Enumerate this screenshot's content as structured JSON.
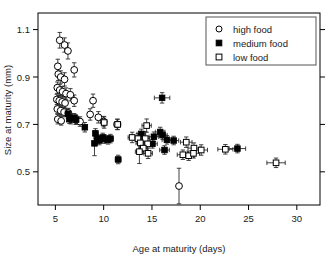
{
  "chart_data": {
    "type": "scatter",
    "title": "",
    "xlabel": "Age at maturity (days)",
    "ylabel": "Size at maturity (mm)",
    "xlim": [
      3.2,
      32.4
    ],
    "ylim": [
      0.36,
      1.17
    ],
    "xticks": [
      5,
      10,
      15,
      20,
      25,
      30
    ],
    "xticklabels": [
      "5",
      "10",
      "15",
      "20",
      "25",
      "30"
    ],
    "yticks": [
      0.5,
      0.7,
      0.9,
      1.1
    ],
    "yticklabels": [
      "0.5",
      "0.7",
      "0.9",
      "1.1"
    ],
    "grid": false,
    "legend_position": "top-right",
    "legend": [
      {
        "label": "high food",
        "marker": "open-circle"
      },
      {
        "label": "medium food",
        "marker": "filled-square"
      },
      {
        "label": "low food",
        "marker": "open-square"
      }
    ],
    "series": [
      {
        "name": "high food",
        "marker": "open-circle",
        "points": [
          {
            "x": 5.45,
            "y": 1.055,
            "xerr": 0.12,
            "yerr": 0.033
          },
          {
            "x": 5.95,
            "y": 1.035,
            "xerr": 0.14,
            "yerr": 0.03
          },
          {
            "x": 6.3,
            "y": 1.01,
            "xerr": 0.16,
            "yerr": 0.034
          },
          {
            "x": 5.25,
            "y": 0.945,
            "xerr": 0.12,
            "yerr": 0.03
          },
          {
            "x": 5.3,
            "y": 0.912,
            "xerr": 0.13,
            "yerr": 0.027
          },
          {
            "x": 5.55,
            "y": 0.9,
            "xerr": 0.14,
            "yerr": 0.026
          },
          {
            "x": 5.95,
            "y": 0.89,
            "xerr": 0.15,
            "yerr": 0.028
          },
          {
            "x": 6.95,
            "y": 0.93,
            "xerr": 0.18,
            "yerr": 0.03
          },
          {
            "x": 5.2,
            "y": 0.855,
            "xerr": 0.12,
            "yerr": 0.024
          },
          {
            "x": 5.45,
            "y": 0.845,
            "xerr": 0.13,
            "yerr": 0.024
          },
          {
            "x": 5.75,
            "y": 0.838,
            "xerr": 0.14,
            "yerr": 0.022
          },
          {
            "x": 6.1,
            "y": 0.83,
            "xerr": 0.16,
            "yerr": 0.024
          },
          {
            "x": 6.55,
            "y": 0.825,
            "xerr": 0.17,
            "yerr": 0.026
          },
          {
            "x": 5.15,
            "y": 0.805,
            "xerr": 0.12,
            "yerr": 0.022
          },
          {
            "x": 5.4,
            "y": 0.8,
            "xerr": 0.12,
            "yerr": 0.022
          },
          {
            "x": 5.7,
            "y": 0.795,
            "xerr": 0.14,
            "yerr": 0.022
          },
          {
            "x": 6.0,
            "y": 0.79,
            "xerr": 0.15,
            "yerr": 0.022
          },
          {
            "x": 6.95,
            "y": 0.8,
            "xerr": 0.18,
            "yerr": 0.024
          },
          {
            "x": 5.2,
            "y": 0.765,
            "xerr": 0.12,
            "yerr": 0.02
          },
          {
            "x": 5.55,
            "y": 0.758,
            "xerr": 0.13,
            "yerr": 0.02
          },
          {
            "x": 5.9,
            "y": 0.752,
            "xerr": 0.14,
            "yerr": 0.02
          },
          {
            "x": 6.35,
            "y": 0.748,
            "xerr": 0.16,
            "yerr": 0.02
          },
          {
            "x": 5.25,
            "y": 0.722,
            "xerr": 0.12,
            "yerr": 0.02
          },
          {
            "x": 5.6,
            "y": 0.715,
            "xerr": 0.13,
            "yerr": 0.018
          },
          {
            "x": 6.6,
            "y": 0.722,
            "xerr": 0.16,
            "yerr": 0.02
          },
          {
            "x": 7.1,
            "y": 0.72,
            "xerr": 0.17,
            "yerr": 0.02
          },
          {
            "x": 7.55,
            "y": 0.712,
            "xerr": 0.19,
            "yerr": 0.02
          },
          {
            "x": 8.9,
            "y": 0.8,
            "xerr": 0.26,
            "yerr": 0.028
          },
          {
            "x": 8.6,
            "y": 0.742,
            "xerr": 0.24,
            "yerr": 0.024
          },
          {
            "x": 9.45,
            "y": 0.73,
            "xerr": 0.26,
            "yerr": 0.024
          },
          {
            "x": 10.0,
            "y": 0.712,
            "xerr": 0.28,
            "yerr": 0.022
          },
          {
            "x": 11.4,
            "y": 0.7,
            "xerr": 0.32,
            "yerr": 0.022
          },
          {
            "x": 17.8,
            "y": 0.44,
            "xerr": 0.0,
            "yerr": 0.075
          }
        ]
      },
      {
        "name": "medium food",
        "marker": "filled-square",
        "points": [
          {
            "x": 6.3,
            "y": 0.745,
            "xerr": 0.16,
            "yerr": 0.02
          },
          {
            "x": 6.45,
            "y": 0.722,
            "xerr": 0.16,
            "yerr": 0.018
          },
          {
            "x": 6.95,
            "y": 0.728,
            "xerr": 0.17,
            "yerr": 0.018
          },
          {
            "x": 7.15,
            "y": 0.72,
            "xerr": 0.18,
            "yerr": 0.018
          },
          {
            "x": 8.05,
            "y": 0.688,
            "xerr": 0.22,
            "yerr": 0.02
          },
          {
            "x": 9.15,
            "y": 0.662,
            "xerr": 0.24,
            "yerr": 0.02
          },
          {
            "x": 9.3,
            "y": 0.64,
            "xerr": 0.24,
            "yerr": 0.018
          },
          {
            "x": 9.55,
            "y": 0.632,
            "xerr": 0.25,
            "yerr": 0.018
          },
          {
            "x": 9.9,
            "y": 0.645,
            "xerr": 0.26,
            "yerr": 0.018
          },
          {
            "x": 10.1,
            "y": 0.638,
            "xerr": 0.26,
            "yerr": 0.018
          },
          {
            "x": 10.45,
            "y": 0.635,
            "xerr": 0.27,
            "yerr": 0.018
          },
          {
            "x": 10.7,
            "y": 0.64,
            "xerr": 0.28,
            "yerr": 0.018
          },
          {
            "x": 9.05,
            "y": 0.62,
            "xerr": 0.24,
            "yerr": 0.052
          },
          {
            "x": 11.5,
            "y": 0.552,
            "xerr": 0.3,
            "yerr": 0.018
          },
          {
            "x": 16.05,
            "y": 0.812,
            "xerr": 0.8,
            "yerr": 0.022
          },
          {
            "x": 13.9,
            "y": 0.66,
            "xerr": 0.45,
            "yerr": 0.02
          },
          {
            "x": 15.2,
            "y": 0.648,
            "xerr": 0.5,
            "yerr": 0.02
          },
          {
            "x": 15.85,
            "y": 0.668,
            "xerr": 0.5,
            "yerr": 0.02
          },
          {
            "x": 16.1,
            "y": 0.655,
            "xerr": 0.48,
            "yerr": 0.018
          },
          {
            "x": 16.55,
            "y": 0.635,
            "xerr": 0.5,
            "yerr": 0.018
          },
          {
            "x": 17.25,
            "y": 0.632,
            "xerr": 0.52,
            "yerr": 0.018
          },
          {
            "x": 15.05,
            "y": 0.618,
            "xerr": 0.5,
            "yerr": 0.018
          },
          {
            "x": 16.3,
            "y": 0.592,
            "xerr": 0.5,
            "yerr": 0.018
          },
          {
            "x": 23.85,
            "y": 0.598,
            "xerr": 0.85,
            "yerr": 0.018
          }
        ]
      },
      {
        "name": "low food",
        "marker": "open-square",
        "points": [
          {
            "x": 10.05,
            "y": 0.708,
            "xerr": 0.28,
            "yerr": 0.024
          },
          {
            "x": 11.45,
            "y": 0.7,
            "xerr": 0.32,
            "yerr": 0.022
          },
          {
            "x": 14.45,
            "y": 0.695,
            "xerr": 0.48,
            "yerr": 0.028
          },
          {
            "x": 12.95,
            "y": 0.645,
            "xerr": 0.42,
            "yerr": 0.022
          },
          {
            "x": 13.55,
            "y": 0.64,
            "xerr": 0.42,
            "yerr": 0.022
          },
          {
            "x": 14.3,
            "y": 0.64,
            "xerr": 0.45,
            "yerr": 0.03
          },
          {
            "x": 13.8,
            "y": 0.622,
            "xerr": 0.45,
            "yerr": 0.022
          },
          {
            "x": 14.55,
            "y": 0.618,
            "xerr": 0.45,
            "yerr": 0.03
          },
          {
            "x": 14.1,
            "y": 0.6,
            "xerr": 0.45,
            "yerr": 0.022
          },
          {
            "x": 13.7,
            "y": 0.585,
            "xerr": 0.42,
            "yerr": 0.05
          },
          {
            "x": 14.6,
            "y": 0.578,
            "xerr": 0.45,
            "yerr": 0.022
          },
          {
            "x": 18.55,
            "y": 0.625,
            "xerr": 0.6,
            "yerr": 0.022
          },
          {
            "x": 19.35,
            "y": 0.6,
            "xerr": 0.62,
            "yerr": 0.022
          },
          {
            "x": 20.1,
            "y": 0.592,
            "xerr": 0.65,
            "yerr": 0.022
          },
          {
            "x": 18.2,
            "y": 0.572,
            "xerr": 0.58,
            "yerr": 0.02
          },
          {
            "x": 18.8,
            "y": 0.568,
            "xerr": 0.6,
            "yerr": 0.02
          },
          {
            "x": 19.3,
            "y": 0.578,
            "xerr": 0.62,
            "yerr": 0.02
          },
          {
            "x": 22.6,
            "y": 0.595,
            "xerr": 0.78,
            "yerr": 0.02
          },
          {
            "x": 27.85,
            "y": 0.538,
            "xerr": 0.95,
            "yerr": 0.02
          }
        ]
      }
    ]
  }
}
